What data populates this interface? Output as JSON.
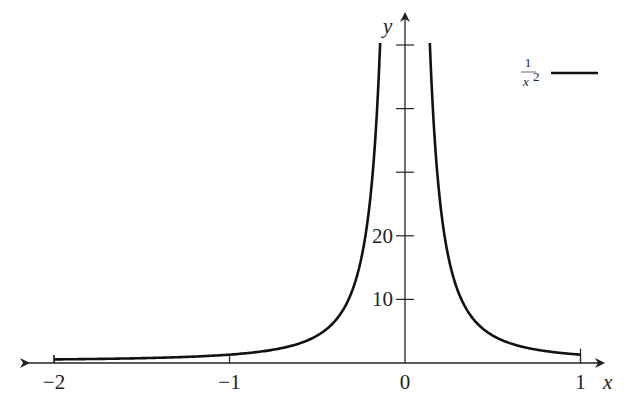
{
  "chart_data": {
    "type": "line",
    "title": "",
    "xlabel": "x",
    "ylabel": "y",
    "xlim": [
      -2,
      1
    ],
    "ylim": [
      0,
      50
    ],
    "grid": false,
    "legend_position": "top-right",
    "x_ticks": [
      {
        "value": -2,
        "label": "−2"
      },
      {
        "value": -1,
        "label": "−1"
      },
      {
        "value": 0,
        "label": "0"
      },
      {
        "value": 1,
        "label": "1"
      }
    ],
    "y_ticks": [
      {
        "value": 10,
        "label": "10"
      },
      {
        "value": 20,
        "label": "20"
      },
      {
        "value": 30,
        "label": ""
      },
      {
        "value": 40,
        "label": ""
      },
      {
        "value": 50,
        "label": ""
      }
    ],
    "series": [
      {
        "name": "1/x^2",
        "legend_numerator": "1",
        "legend_denominator": "x",
        "legend_exponent": "2",
        "color": "#111111",
        "x": [
          -2,
          -1.5,
          -1,
          -0.75,
          -0.5,
          -0.4,
          -0.3,
          -0.25,
          -0.2,
          -0.16,
          -0.1414,
          0.1414,
          0.16,
          0.2,
          0.25,
          0.3,
          0.4,
          0.5,
          0.75,
          1
        ],
        "values": [
          0.25,
          0.44,
          1,
          1.78,
          4,
          6.25,
          11.1,
          16,
          25,
          39,
          50,
          50,
          39,
          25,
          16,
          11.1,
          6.25,
          4,
          1.78,
          1
        ]
      }
    ]
  }
}
